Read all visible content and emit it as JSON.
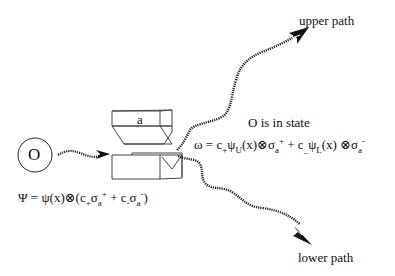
{
  "diagram": {
    "type": "Stern-Gerlach measurement schematic",
    "observer_symbol": "O",
    "magnet_label": "a",
    "labels": {
      "upper_path": "upper path",
      "lower_path": "lower path",
      "state_caption": "O is in state"
    },
    "equations": {
      "initial_state": {
        "lhs": "Ψ",
        "eq": " = ψ(x)⊗(c",
        "c_plus_sub": "+",
        "sigma1": "σ",
        "sigma1_sub": "a",
        "sigma1_sup": "+",
        "plus": " + c",
        "c_minus_sub": "-",
        "sigma2": "σ",
        "sigma2_sub": "a",
        "sigma2_sup": "-",
        "close": ")"
      },
      "final_state": {
        "lhs": "ω = c",
        "c_plus_sub": "+",
        "psi_u": "ψ",
        "psi_u_sub": "U",
        "mid1": "(x)⊗σ",
        "sigma1_sub": "a",
        "sigma1_sup": "+",
        "plus": " + c",
        "c_minus_sub": "_",
        "psi_l": "ψ",
        "psi_l_sub": "L",
        "mid2": "(x) ⊗σ",
        "sigma2_sub": "a",
        "sigma2_sup": "-"
      }
    },
    "colors": {
      "ink": "#111111",
      "background": "#ffffff"
    }
  }
}
